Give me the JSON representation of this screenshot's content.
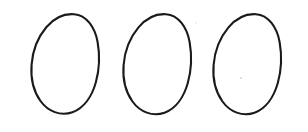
{
  "figure": {
    "background_color": "#ffffff",
    "stroke_color": "#1a1a1a",
    "fill_color": "#ffffff",
    "stroke_width": 2.1,
    "shape_count": 3,
    "canvas": {
      "width": 308,
      "height": 132
    },
    "shapes": [
      {
        "name": "egg-1",
        "label": "Egg 1",
        "bounds": {
          "x": 31,
          "y": 13,
          "width": 68,
          "height": 101
        },
        "center": {
          "x": 65,
          "y": 66
        },
        "apex": {
          "x": 74,
          "y": 14
        },
        "widest_y": 68,
        "path": "M 74.0 14.2 C 86.5 15.0 95.0 27.5 97.6 42.0 C 100.2 56.5 99.3 70.0 95.8 82.5 C 92.0 96.0 84.0 108.0 72.5 112.2 C 60.5 116.4 48.0 111.5 40.5 101.0 C 33.2 90.8 30.6 77.0 31.6 64.5 C 32.7 50.5 38.0 37.0 46.5 27.0 C 54.2 17.9 63.8 13.5 74.0 14.2 Z"
      },
      {
        "name": "egg-2",
        "label": "Egg 2",
        "bounds": {
          "x": 123,
          "y": 13,
          "width": 68,
          "height": 102
        },
        "center": {
          "x": 157,
          "y": 66
        },
        "apex": {
          "x": 166,
          "y": 14
        },
        "widest_y": 68,
        "path": "M 166.0 14.2 C 178.5 15.0 187.0 27.5 189.6 42.0 C 192.2 56.5 191.3 70.5 187.8 83.0 C 184.0 96.5 176.0 108.5 164.5 112.7 C 152.5 116.9 140.0 112.0 132.5 101.5 C 125.2 91.3 122.6 77.5 123.6 65.0 C 124.7 51.0 130.0 37.5 138.5 27.4 C 146.2 18.2 155.8 13.5 166.0 14.2 Z"
      },
      {
        "name": "egg-3",
        "label": "Egg 3",
        "bounds": {
          "x": 213,
          "y": 13,
          "width": 68,
          "height": 102
        },
        "center": {
          "x": 247,
          "y": 66
        },
        "apex": {
          "x": 256,
          "y": 14
        },
        "widest_y": 68,
        "path": "M 256.0 14.2 C 268.5 15.0 277.0 27.5 279.6 42.0 C 282.2 56.5 281.3 70.5 277.8 83.0 C 274.0 96.5 266.0 108.5 254.5 112.7 C 242.5 116.9 230.0 112.0 222.5 101.5 C 215.2 91.3 212.6 77.5 213.6 65.0 C 214.7 51.0 220.0 37.5 228.5 27.4 C 236.2 18.2 245.8 13.5 256.0 14.2 Z"
      }
    ],
    "specks": [
      {
        "name": "speck-1",
        "x": 241,
        "y": 78,
        "r": 1.0
      },
      {
        "name": "speck-2",
        "x": 196,
        "y": 23,
        "r": 0.7
      }
    ]
  }
}
